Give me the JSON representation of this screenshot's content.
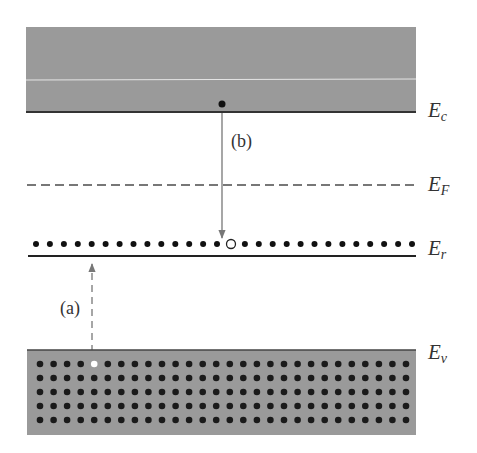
{
  "diagram": {
    "type": "energy-band-diagram",
    "colors": {
      "band_fill": "#9a9a9a",
      "band_edge": "#333333",
      "electron": "#111111",
      "hole": "#ffffff",
      "arrow": "#777777",
      "dashed_level": "#777777",
      "label": "#333333"
    },
    "levels": {
      "conduction": {
        "symbol": "E",
        "subscript": "c",
        "label": "E_c"
      },
      "fermi": {
        "symbol": "E",
        "subscript": "F",
        "label": "E_F"
      },
      "trap": {
        "symbol": "E",
        "subscript": "r",
        "label": "E_r"
      },
      "valence": {
        "symbol": "E",
        "subscript": "v",
        "label": "E_v"
      }
    },
    "transitions": {
      "a": {
        "label": "(a)",
        "style": "dashed",
        "from": "valence",
        "to": "trap",
        "description": "electron excited from valence band to recombination level, leaving hole"
      },
      "b": {
        "label": "(b)",
        "style": "solid",
        "from": "conduction",
        "to": "trap",
        "description": "electron captured from conduction band into empty recombination center"
      }
    },
    "trap_level": {
      "dot_count": 28,
      "empty_index": 14
    },
    "valence_band": {
      "rows": 5,
      "cols": 28,
      "hole_row": 0,
      "hole_col": 4
    },
    "conduction_band": {
      "electron_count": 1
    }
  }
}
